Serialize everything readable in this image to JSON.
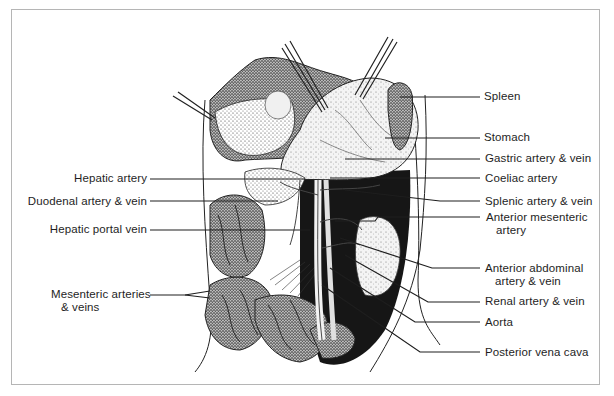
{
  "figure": {
    "colors": {
      "ink": "#1e1e1e",
      "frame": "#b5b5b5",
      "background": "#ffffff"
    },
    "labels_left": [
      {
        "id": "hepatic-artery",
        "text": "Hepatic artery"
      },
      {
        "id": "duodenal-artery-vein",
        "text": "Duodenal artery & vein"
      },
      {
        "id": "hepatic-portal-vein",
        "text": "Hepatic portal vein"
      },
      {
        "id": "mesenteric-arteries-veins",
        "line1": "Mesenteric arteries",
        "line2": "& veins"
      }
    ],
    "labels_right": [
      {
        "id": "spleen",
        "text": "Spleen"
      },
      {
        "id": "stomach",
        "text": "Stomach"
      },
      {
        "id": "gastric-artery-vein",
        "text": "Gastric artery & vein"
      },
      {
        "id": "coeliac-artery",
        "text": "Coeliac artery"
      },
      {
        "id": "splenic-artery-vein",
        "text": "Splenic artery & vein"
      },
      {
        "id": "anterior-mesenteric-artery",
        "line1": "Anterior mesenteric",
        "line2": "artery"
      },
      {
        "id": "anterior-abdominal-artery-vein",
        "line1": "Anterior abdominal",
        "line2": "artery & vein"
      },
      {
        "id": "renal-artery-vein",
        "text": "Renal artery & vein"
      },
      {
        "id": "aorta",
        "text": "Aorta"
      },
      {
        "id": "posterior-vena-cava",
        "text": "Posterior vena cava"
      }
    ]
  }
}
